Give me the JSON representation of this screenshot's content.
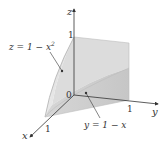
{
  "figure": {
    "type": "3d-region-diagram",
    "axes": {
      "x": {
        "label": "x",
        "tick": "1"
      },
      "y": {
        "label": "y",
        "tick": "1"
      },
      "z": {
        "label": "z",
        "tick": "1"
      },
      "origin_label": "0"
    },
    "annotations": [
      {
        "id": "surface-parabolic",
        "text_lhs": "z = 1 − x",
        "exponent": "2"
      },
      {
        "id": "plane",
        "text": "y = 1 − x"
      }
    ],
    "colors": {
      "surface_light": "#e4e4e4",
      "surface_mid": "#d2d2d2",
      "surface_dark": "#c4c4c4",
      "edge": "#a8a8a8",
      "axis": "#333333"
    }
  }
}
